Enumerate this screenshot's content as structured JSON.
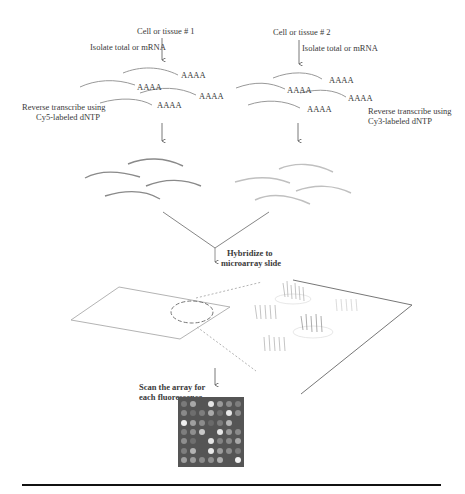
{
  "diagram": {
    "sample1": {
      "label": "Cell or tissue # 1",
      "step1": "Isolate total or mRNA",
      "polyA": [
        "AAAA",
        "AAAA",
        "AAAA",
        "AAAA"
      ],
      "step2_line1": "Reverse transcribe using",
      "step2_line2": "Cy5-labeled dNTP"
    },
    "sample2": {
      "label": "Cell or tissue # 2",
      "step1": "Isolate total or mRNA",
      "polyA": [
        "AAAA",
        "AAAA",
        "AAAA",
        "AAAA"
      ],
      "step2_line1": "Reverse transcribe using",
      "step2_line2": "Cy3-labeled dNTP"
    },
    "hybridize_line1": "Hybridize to",
    "hybridize_line2": "microarray slide",
    "scan_line1": "Scan the array for",
    "scan_line2": "each fluorescence",
    "colors": {
      "cy5_strand": "#8a8a8a",
      "cy3_strand": "#bdbdbd",
      "array_bg": "#555555",
      "rule": "#111111"
    },
    "array_spots": [
      [
        "#7a7a7a",
        "#a8a8a8",
        "#555555",
        "#e6e6e6",
        "#9a9a9a",
        "#8c8c8c",
        "#7d7d7d"
      ],
      [
        "#8a8a8a",
        "#6e6e6e",
        "#7e7e7e",
        "#a9a9a9",
        "#6f6f6f",
        "#e8e8e8",
        "#8e8e8e"
      ],
      [
        "#efefef",
        "#a0a0a0",
        "#8c8c8c",
        "#6a6a6a",
        "#7c7c7c",
        "#b4b4b4",
        "#555555"
      ],
      [
        "#7e7e7e",
        "#8f8f8f",
        "#c9c9c9",
        "#555555",
        "#e7e7e7",
        "#9a9a9a",
        "#8a8a8a"
      ],
      [
        "#8f8f8f",
        "#6f6f6f",
        "#555555",
        "#e4e4e4",
        "#838383",
        "#8a8a8a",
        "#a8a8a8"
      ],
      [
        "#7e7e7e",
        "#b3b3b3",
        "#555555",
        "#e9e9e9",
        "#9c9c9c",
        "#8d8d8d",
        "#7c7c7c"
      ],
      [
        "#a0a0a0",
        "#9c9c9c",
        "#8a8a8a",
        "#8f8f8f",
        "#b0b0b0",
        "#555555",
        "#f2f2f2"
      ]
    ]
  }
}
